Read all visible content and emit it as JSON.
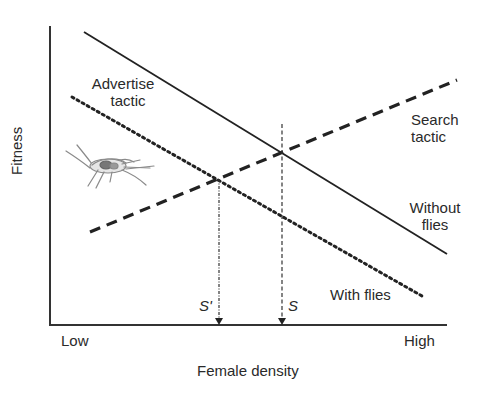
{
  "diagram": {
    "axes": {
      "y_label": "Fitness",
      "x_label": "Female density",
      "x_low": "Low",
      "x_high": "High"
    },
    "lines": {
      "advertise_label_line1": "Advertise",
      "advertise_label_line2": "tactic",
      "search_label_line1": "Search",
      "search_label_line2": "tactic",
      "without_flies_line1": "Without",
      "without_flies_line2": "flies",
      "with_flies": "With flies"
    },
    "markers": {
      "s": "S",
      "s_prime": "S'"
    },
    "illustration": "cricket-icon",
    "colors": {
      "line": "#222222",
      "illustration": "#8a8a8a",
      "background": "#ffffff"
    }
  }
}
